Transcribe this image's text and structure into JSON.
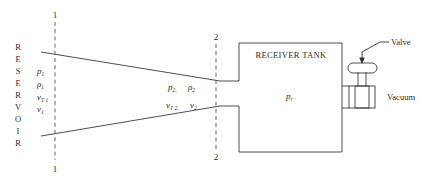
{
  "figure": {
    "reservoir_label": "RESERVOIR",
    "reservoir_letters": [
      "R",
      "E",
      "S",
      "E",
      "R",
      "V",
      "O",
      "I",
      "R"
    ],
    "tank_label": "RECEIVER TANK",
    "tank_pressure": {
      "base": "p",
      "sub": "r"
    },
    "valve_label": "Valve",
    "vacuum_label": "Vacuum",
    "stations": {
      "one": {
        "top_label": "1",
        "bottom_label": "1",
        "properties": [
          {
            "base": "p",
            "sub": "1"
          },
          {
            "base": "ρ",
            "sub": "1"
          },
          {
            "base": "v",
            "sub": "T 1"
          },
          {
            "base": "v",
            "sub": "1"
          }
        ]
      },
      "two": {
        "top_label": "2",
        "bottom_label": "2",
        "row_one": [
          {
            "base": "p",
            "sub": "2"
          },
          {
            "base": "ρ",
            "sub": "2"
          }
        ],
        "row_two": [
          {
            "base": "v",
            "sub": "T 2"
          },
          {
            "base": "v",
            "sub": "2"
          }
        ],
        "separator": ","
      }
    },
    "colors": {
      "line": "#3a3a3a",
      "dashed": "#555555",
      "text": "#2b2b2b",
      "background": "#ffffff"
    }
  }
}
